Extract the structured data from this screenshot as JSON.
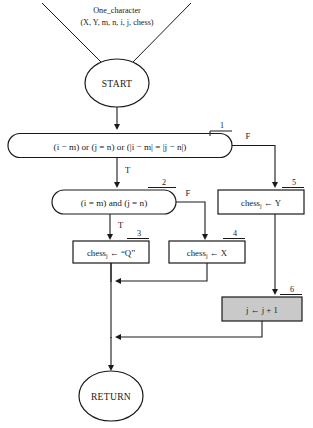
{
  "diagram": {
    "type": "flowchart",
    "header": {
      "line1": "One_character",
      "line2": "(X, Y, m, n, i, j, chess)"
    },
    "terminals": {
      "start": "START",
      "end": "RETURN"
    },
    "nodes": [
      {
        "id": "1",
        "number": "1",
        "shape": "stadium",
        "kind": "condition",
        "text": "(i − m) or (j = n) or (|i − m| = |j − n|)",
        "true_label": "T",
        "false_label": "F"
      },
      {
        "id": "2",
        "number": "2",
        "shape": "stadium",
        "kind": "condition",
        "text": "(i = m) and (j = n)",
        "true_label": "T",
        "false_label": "F"
      },
      {
        "id": "3",
        "number": "3",
        "shape": "rectangle",
        "kind": "process",
        "text_base": "chess",
        "text_sub": "j",
        "text_rest": " ← “Q”",
        "shaded": false
      },
      {
        "id": "4",
        "number": "4",
        "shape": "rectangle",
        "kind": "process",
        "text_base": "chess",
        "text_sub": "j",
        "text_rest": " ← X",
        "shaded": false
      },
      {
        "id": "5",
        "number": "5",
        "shape": "rectangle",
        "kind": "process",
        "text_base": "chess",
        "text_sub": "j",
        "text_rest": " ← Y",
        "shaded": false
      },
      {
        "id": "6",
        "number": "6",
        "shape": "rectangle",
        "kind": "process",
        "text_base": "j ← j + 1",
        "text_sub": "",
        "text_rest": "",
        "shaded": true
      }
    ],
    "branch_labels": {
      "n1_true": "T",
      "n1_false": "F",
      "n2_true": "T",
      "n2_false": "F"
    },
    "numbers": {
      "n1": "1",
      "n2": "2",
      "n3": "3",
      "n4": "4",
      "n5": "5",
      "n6": "6"
    },
    "colors": {
      "stroke": "#1a1a1a",
      "background": "#ffffff",
      "shaded_fill": "#c9c9c9"
    }
  }
}
